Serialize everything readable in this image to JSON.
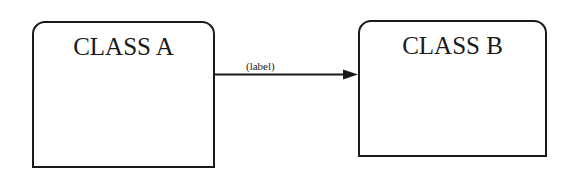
{
  "diagram": {
    "type": "class-diagram",
    "nodes": [
      {
        "id": "class-a",
        "title": "CLASS A"
      },
      {
        "id": "class-b",
        "title": "CLASS B"
      }
    ],
    "edges": [
      {
        "from": "class-a",
        "to": "class-b",
        "label": "(label)",
        "arrow": "filled-triangle-at-target"
      }
    ],
    "colors": {
      "stroke": "#1a1a1a",
      "background": "#ffffff"
    }
  }
}
